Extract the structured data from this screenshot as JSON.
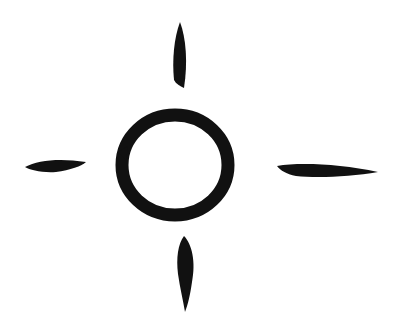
{
  "image": {
    "description": "Hand-drawn sun / compass style symbol: a brush-stroke circle surrounded by four tapered strokes",
    "background": "#ffffff",
    "ink_color": "#111111"
  },
  "symbol": {
    "ring": {
      "cx": 175,
      "cy": 165,
      "rx": 53,
      "ry": 50,
      "stroke_width": 13
    },
    "rays": [
      {
        "name": "top",
        "cx": 180,
        "cy": 56,
        "rx": 7,
        "ry": 33,
        "rotate": 0
      },
      {
        "name": "bottom",
        "cx": 185,
        "cy": 273,
        "rx": 10,
        "ry": 37,
        "rotate": -4
      },
      {
        "name": "left",
        "cx": 56,
        "cy": 165,
        "rx": 31,
        "ry": 7,
        "rotate": -3
      },
      {
        "name": "right",
        "cx": 328,
        "cy": 170,
        "rx": 51,
        "ry": 7,
        "rotate": 3
      }
    ]
  }
}
